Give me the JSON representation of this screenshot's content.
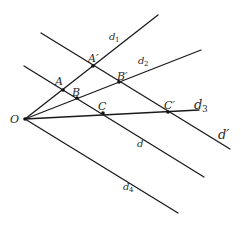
{
  "diagram": {
    "title": "",
    "points": {
      "O": {
        "label": "O",
        "x": 25,
        "y": 119
      },
      "A": {
        "label": "A",
        "x": 63,
        "y": 90
      },
      "B": {
        "label": "B",
        "x": 77,
        "y": 98
      },
      "C": {
        "label": "C",
        "x": 103,
        "y": 113
      },
      "A_prime": {
        "label": "A′",
        "x": 93,
        "y": 66
      },
      "B_prime": {
        "label": "B′",
        "x": 119,
        "y": 82
      },
      "C_prime": {
        "label": "C′",
        "x": 168,
        "y": 112
      }
    },
    "lines": {
      "d1": {
        "base": "d",
        "sub": "1"
      },
      "d2": {
        "base": "d",
        "sub": "2"
      },
      "d3": {
        "base": "d",
        "sub": "3"
      },
      "d4": {
        "base": "d",
        "sub": "4"
      },
      "d": {
        "base": "d",
        "sub": ""
      },
      "d_prime": {
        "base": "d′",
        "sub": ""
      }
    },
    "colors": {
      "stroke": "#1a1a1a",
      "text": "#2a2a2a",
      "background": "#ffffff"
    }
  }
}
